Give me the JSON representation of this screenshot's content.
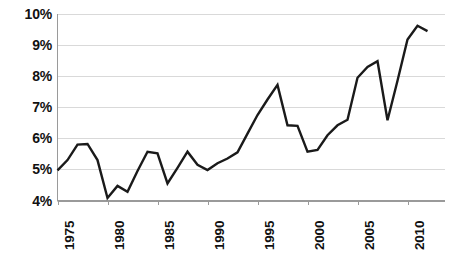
{
  "chart_data": {
    "type": "line",
    "title": "",
    "subtitle": "",
    "xlabel": "",
    "ylabel": "",
    "xlim": [
      1975,
      2012
    ],
    "ylim": [
      4,
      10
    ],
    "grid": true,
    "legend": null,
    "line_color": "#1a1a1a",
    "gridline_color": "#d9d9d9",
    "axis_color": "#808080",
    "y_tick_labels": [
      "10%",
      "9%",
      "8%",
      "7%",
      "6%",
      "5%",
      "4%"
    ],
    "y_tick_values": [
      10,
      9,
      8,
      7,
      6,
      5,
      4
    ],
    "x_tick_labels": [
      "1975",
      "1980",
      "1985",
      "1990",
      "1995",
      "2000",
      "2005",
      "2010"
    ],
    "x_tick_values": [
      1975,
      1980,
      1985,
      1990,
      1995,
      2000,
      2005,
      2010
    ],
    "x": [
      1975,
      1976,
      1977,
      1978,
      1979,
      1980,
      1981,
      1982,
      1983,
      1984,
      1985,
      1986,
      1987,
      1988,
      1989,
      1990,
      1991,
      1992,
      1993,
      1994,
      1995,
      1996,
      1997,
      1998,
      1999,
      2000,
      2001,
      2002,
      2003,
      2004,
      2005,
      2006,
      2007,
      2008,
      2009,
      2010,
      2011,
      2012
    ],
    "values": [
      4.97,
      5.3,
      5.8,
      5.82,
      5.3,
      4.08,
      4.47,
      4.28,
      4.95,
      5.57,
      5.52,
      4.55,
      5.05,
      5.57,
      5.15,
      4.98,
      5.2,
      5.35,
      5.55,
      6.15,
      6.75,
      7.25,
      7.72,
      6.42,
      6.4,
      5.57,
      5.63,
      6.1,
      6.42,
      6.6,
      7.95,
      8.3,
      8.48,
      6.58,
      7.85,
      9.18,
      9.62,
      9.45
    ],
    "series_name": ""
  }
}
